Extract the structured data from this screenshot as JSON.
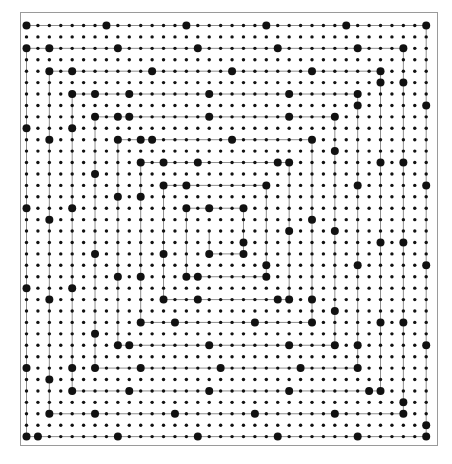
{
  "figure": {
    "width": 452,
    "height": 464,
    "background_color": "#ffffff"
  },
  "frame": {
    "name": "plot-frame",
    "x": 20,
    "y": 12,
    "width": 418,
    "height": 434,
    "border_color": "#9a9a9a",
    "border_width": 1,
    "fill_color": "#ffffff"
  },
  "grid": {
    "columns": 36,
    "rows": 37,
    "origin_x": 26.5,
    "origin_y": 25.5,
    "spacing_x": 11.42,
    "spacing_y": 11.42,
    "dot_color": "#111111",
    "small_dot_radius": 1.7,
    "large_dot_radius": 4.0
  },
  "spiral": {
    "type": "square-spiral",
    "direction": "inward",
    "winding": "clockwise",
    "arm_gap_cells": 2,
    "line_color": "#8f8f8f",
    "line_width": 1.0,
    "start_cell": [
      0,
      0
    ],
    "description": "A rectangular spiral path traced over grid vertices; grid points lying on the spiral corners and path are drawn as enlarged dots."
  },
  "chart_data": {
    "type": "scatter",
    "xlabel": "",
    "ylabel": "",
    "grid": true,
    "legend": "none",
    "categories": [],
    "values": [],
    "xlim": [
      0,
      35
    ],
    "ylim": [
      0,
      36
    ],
    "series": [
      {
        "name": "grid-dots-small",
        "marker": "circle",
        "color": "#111111",
        "size": 3.4,
        "count": 1332
      },
      {
        "name": "spiral-dots-large",
        "marker": "circle",
        "color": "#111111",
        "size": 8.0,
        "count": 120
      },
      {
        "name": "spiral-path",
        "marker": "line",
        "color": "#8f8f8f",
        "size": 1.0
      }
    ]
  }
}
